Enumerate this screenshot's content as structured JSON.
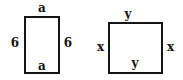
{
  "figure": {
    "background_color": "#ffffff",
    "stroke_color": "#151515",
    "label_color": "#141414",
    "shapes": [
      {
        "name": "rectangle-left",
        "kind": "rectangle",
        "labels": {
          "top": "a",
          "bottom": "a",
          "left": "6",
          "right": "6"
        }
      },
      {
        "name": "rectangle-right",
        "kind": "rectangle",
        "labels": {
          "top": "y",
          "bottom": "y",
          "left": "x",
          "right": "x"
        }
      }
    ]
  }
}
